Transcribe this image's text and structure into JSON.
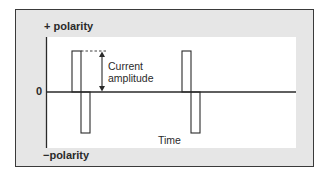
{
  "diagram": {
    "type": "waveform",
    "labels": {
      "positive_polarity": "+ polarity",
      "negative_polarity": "−polarity",
      "zero": "0",
      "time_axis": "Time",
      "amplitude_line1": "Current",
      "amplitude_line2": "amplitude"
    },
    "pulses": [
      {
        "phase": "positive",
        "x_start": 72,
        "x_end": 81,
        "top": 51
      },
      {
        "phase": "negative",
        "x_start": 81,
        "x_end": 90,
        "bottom": 133
      },
      {
        "phase": "positive",
        "x_start": 182,
        "x_end": 191,
        "top": 51
      },
      {
        "phase": "negative",
        "x_start": 191,
        "x_end": 200,
        "bottom": 133
      }
    ],
    "baseline_y": 92,
    "colors": {
      "frame_fill": "#e6e6e6",
      "plot_fill": "#ffffff",
      "stroke": "#2a2a2a"
    }
  }
}
